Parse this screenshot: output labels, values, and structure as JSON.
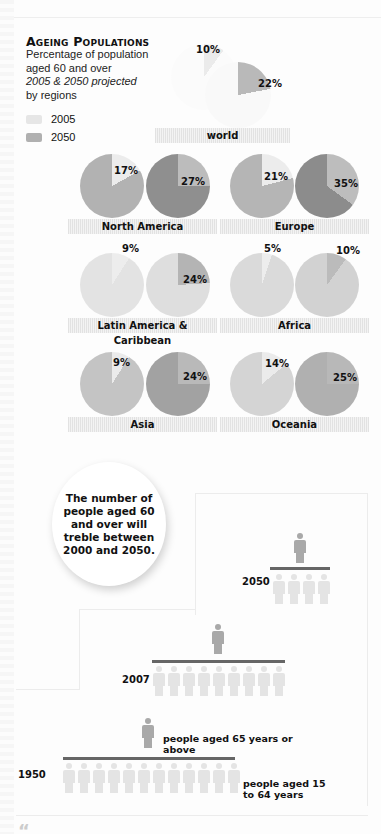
{
  "header": {
    "title": "Ageing Populations",
    "subtitle_lines": [
      "Percentage of population",
      "aged 60 and over"
    ],
    "subtitle_italic": "2005 & 2050 projected",
    "subtitle_last": "by regions"
  },
  "legend": [
    {
      "label": "2005",
      "color": "#e6e6e6"
    },
    {
      "label": "2050",
      "color": "#b0b0b0"
    }
  ],
  "chart_data": {
    "type": "pie",
    "title": "Ageing Populations",
    "subtitle": "Percentage of population aged 60 and over, 2005 & 2050 projected, by regions",
    "series_names": [
      "2005",
      "2050"
    ],
    "regions": [
      {
        "name": "world",
        "2005": 10,
        "2050": 22
      },
      {
        "name": "North America",
        "2005": 17,
        "2050": 27
      },
      {
        "name": "Europe",
        "2005": 21,
        "2050": 35
      },
      {
        "name": "Latin America & Caribbean",
        "2005": 9,
        "2050": 24
      },
      {
        "name": "Africa",
        "2005": 5,
        "2050": 10
      },
      {
        "name": "Asia",
        "2005": 9,
        "2050": 24
      },
      {
        "name": "Oceania",
        "2005": 14,
        "2050": 25
      }
    ]
  },
  "pies": [
    {
      "region": "world",
      "p05": "10%",
      "p50": "22%"
    },
    {
      "region": "North America",
      "p05": "17%",
      "p50": "27%"
    },
    {
      "region": "Europe",
      "p05": "21%",
      "p50": "35%"
    },
    {
      "region": "Latin America & Caribbean",
      "p05": "9%",
      "p50": "24%"
    },
    {
      "region": "Africa",
      "p05": "5%",
      "p50": "10%"
    },
    {
      "region": "Asia",
      "p05": "9%",
      "p50": "24%"
    },
    {
      "region": "Oceania",
      "p05": "14%",
      "p50": "25%"
    }
  ],
  "callout": "The number of people aged 60 and over will treble between 2000 and 2050.",
  "pictogram": {
    "rows": [
      {
        "year": "2050",
        "young_count": 4,
        "old_count": 1
      },
      {
        "year": "2007",
        "young_count": 9,
        "old_count": 1
      },
      {
        "year": "1950",
        "young_count": 12,
        "old_count": 1
      }
    ],
    "label_old": "people aged 65 years or above",
    "label_young": "people aged 15 to 64 years"
  },
  "footer_quote_mark": "“"
}
